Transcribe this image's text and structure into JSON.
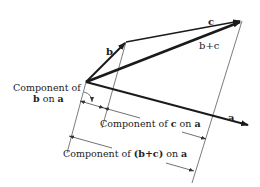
{
  "diagram": {
    "vectors": {
      "a": {
        "label": "a",
        "from": [
          86,
          82
        ],
        "to": [
          250,
          126
        ]
      },
      "b": {
        "label": "b",
        "from": [
          86,
          82
        ],
        "to": [
          126,
          42
        ]
      },
      "c": {
        "label": "c",
        "from": [
          126,
          42
        ],
        "to": [
          242,
          21
        ]
      },
      "b_plus_c": {
        "label": "b+c",
        "from": [
          86,
          82
        ],
        "to": [
          242,
          21
        ]
      }
    },
    "labels": {
      "component_b_line1": "Component of",
      "component_b_line2_bold": "b",
      "component_b_line2_rest": " on ",
      "component_b_line2_a": "a",
      "component_c_prefix": "Component of ",
      "component_c_vec": "c",
      "component_c_mid": " on ",
      "component_c_a": "a",
      "component_bc_prefix": "Component of ",
      "component_bc_vec": "(b+c)",
      "component_bc_mid": " on ",
      "component_bc_a": "a",
      "vec_a": "a",
      "vec_b": "b",
      "vec_c": "c",
      "vec_bc": "b+c"
    },
    "colors": {
      "ink": "#1a1a1a",
      "thin": "#444444",
      "background": "#ffffff"
    }
  }
}
